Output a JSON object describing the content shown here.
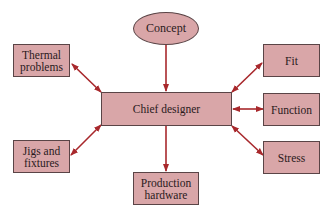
{
  "diagram": {
    "nodes": {
      "concept": {
        "label": "Concept",
        "shape": "ellipse"
      },
      "chief": {
        "label": "Chief designer",
        "shape": "rect"
      },
      "thermal": {
        "label": "Thermal problems",
        "line1": "Thermal",
        "line2": "problems",
        "shape": "rect"
      },
      "jigs": {
        "label": "Jigs and fixtures",
        "line1": "Jigs and",
        "line2": "fixtures",
        "shape": "rect"
      },
      "production": {
        "label": "Production hardware",
        "line1": "Production",
        "line2": "hardware",
        "shape": "rect"
      },
      "fit": {
        "label": "Fit",
        "shape": "rect"
      },
      "function": {
        "label": "Function",
        "shape": "rect"
      },
      "stress": {
        "label": "Stress",
        "shape": "rect"
      }
    },
    "edges": [
      {
        "from": "concept",
        "to": "chief",
        "type": "one-way"
      },
      {
        "from": "chief",
        "to": "production",
        "type": "one-way"
      },
      {
        "from": "chief",
        "to": "thermal",
        "type": "two-way"
      },
      {
        "from": "chief",
        "to": "jigs",
        "type": "two-way"
      },
      {
        "from": "chief",
        "to": "fit",
        "type": "two-way"
      },
      {
        "from": "chief",
        "to": "function",
        "type": "two-way"
      },
      {
        "from": "chief",
        "to": "stress",
        "type": "two-way"
      }
    ],
    "colors": {
      "fill": "#d9a6a8",
      "border": "#5a4446",
      "arrow": "#a8282c"
    }
  }
}
